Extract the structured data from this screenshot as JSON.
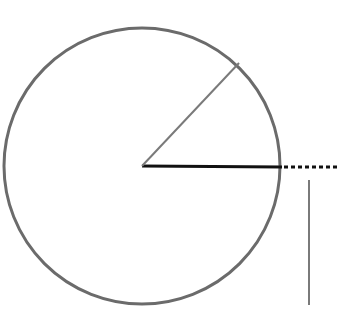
{
  "diagram": {
    "canvas": {
      "width": 353,
      "height": 313,
      "background": "#ffffff"
    },
    "circle": {
      "cx": 142,
      "cy": 166,
      "r": 138,
      "stroke": "#6b6b6b",
      "stroke_width": 3
    },
    "radius_line": {
      "x1": 142,
      "y1": 166,
      "x2": 282,
      "y2": 167,
      "stroke": "#111111",
      "stroke_width": 3
    },
    "angled_line": {
      "x1": 142,
      "y1": 166,
      "x2": 239,
      "y2": 63,
      "stroke": "#7a7a7a",
      "stroke_width": 2
    },
    "dotted_extension": {
      "x1": 284,
      "y1": 167,
      "x2": 340,
      "y2": 167,
      "stroke": "#111111",
      "stroke_width": 3,
      "dash": "4 3"
    },
    "vertical_line": {
      "x1": 309,
      "y1": 180,
      "x2": 309,
      "y2": 305,
      "stroke": "#7a7a7a",
      "stroke_width": 2
    }
  }
}
